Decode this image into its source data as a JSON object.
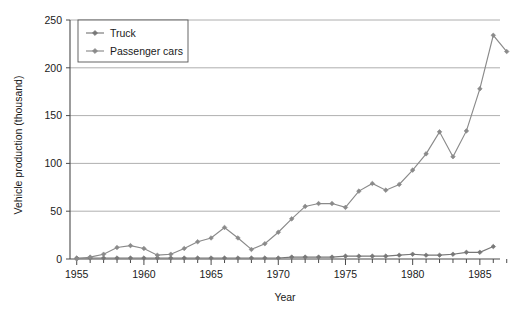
{
  "chart_data": {
    "type": "line",
    "title": "",
    "xlabel": "Year",
    "ylabel": "Vehicle production (thousand)",
    "xlim": [
      1954.5,
      1986.5
    ],
    "ylim": [
      0,
      250
    ],
    "yticks": [
      0,
      50,
      100,
      150,
      200,
      250
    ],
    "xticks_major": [
      1955,
      1960,
      1965,
      1970,
      1975,
      1980,
      1985
    ],
    "xtick_labels": [
      "1955",
      "1960",
      "1965",
      "1970",
      "1975",
      "1980",
      "1985"
    ],
    "ytick_labels": [
      "0",
      "50",
      "100",
      "150",
      "200",
      "250"
    ],
    "grid": true,
    "grid_axis": "y",
    "legend_position": "top-left",
    "x": [
      1955,
      1956,
      1957,
      1958,
      1959,
      1960,
      1961,
      1962,
      1963,
      1964,
      1965,
      1966,
      1967,
      1968,
      1969,
      1970,
      1971,
      1972,
      1973,
      1974,
      1975,
      1976,
      1977,
      1978,
      1979,
      1980,
      1981,
      1982,
      1983,
      1984,
      1985,
      1986
    ],
    "series": [
      {
        "name": "Truck",
        "color": "#777777",
        "marker": "diamond",
        "values": [
          1,
          1,
          1,
          1,
          1,
          1,
          1,
          1,
          1,
          1,
          1,
          1,
          1,
          1,
          1,
          1,
          2,
          2,
          2,
          2,
          3,
          3,
          3,
          3,
          4,
          5,
          4,
          4,
          5,
          7,
          7,
          13
        ]
      },
      {
        "name": "Passenger cars",
        "color": "#8a8a8a",
        "marker": "diamond",
        "values": [
          0,
          2,
          5,
          12,
          14,
          11,
          4,
          5,
          11,
          18,
          22,
          33,
          22,
          10,
          16,
          28,
          42,
          55,
          58,
          58,
          54,
          71,
          79,
          72,
          78,
          93,
          110,
          133,
          107,
          134,
          178,
          234
        ]
      }
    ],
    "extra_last_point": {
      "series": "Passenger cars",
      "x": 1987,
      "y": 217
    },
    "legend_entries": [
      {
        "label": "Truck",
        "color": "#777777"
      },
      {
        "label": "Passenger cars",
        "color": "#8a8a8a"
      }
    ]
  },
  "axes": {
    "y_title": "Vehicle production (thousand)",
    "x_title": "Year"
  }
}
